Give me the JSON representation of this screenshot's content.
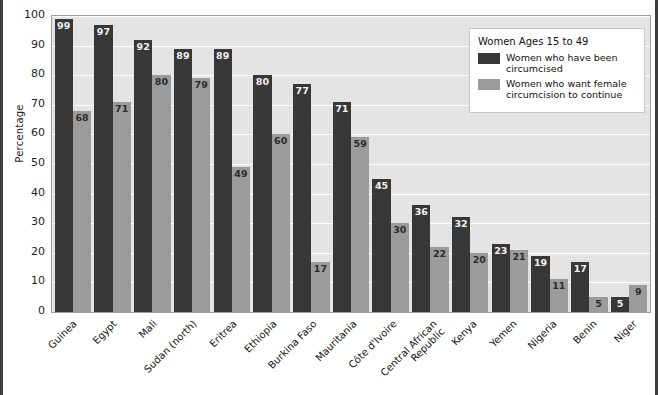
{
  "chart_data": {
    "type": "bar",
    "title": "",
    "xlabel": "",
    "ylabel": "Percentage",
    "ylim": [
      0,
      100
    ],
    "yticks": [
      100,
      90,
      80,
      70,
      60,
      50,
      40,
      30,
      20,
      10,
      0
    ],
    "grid": true,
    "legend_position": "top-right",
    "legend_title": "Women Ages 15 to 49",
    "categories": [
      "Guinea",
      "Egypt",
      "Mali",
      "Sudan (north)",
      "Eritrea",
      "Ethiopia",
      "Burkina Faso",
      "Mauritania",
      "Côte d'Ivoire",
      "Central African Republic",
      "Kenya",
      "Yemen",
      "Nigeria",
      "Benin",
      "Niger"
    ],
    "series": [
      {
        "name": "Women who have been circumcised",
        "color": "#373737",
        "values": [
          99,
          97,
          92,
          89,
          89,
          80,
          77,
          71,
          45,
          36,
          32,
          23,
          19,
          17,
          5
        ]
      },
      {
        "name": "Women who want female circumcision to continue",
        "color": "#9b9b9b",
        "values": [
          68,
          71,
          80,
          79,
          49,
          60,
          17,
          59,
          30,
          22,
          20,
          21,
          11,
          5,
          9
        ]
      }
    ]
  },
  "axis": {
    "y_title": "Percentage"
  },
  "legend": {
    "title": "Women Ages 15 to 49",
    "entries": [
      {
        "swatch": "dark",
        "line1": "Women who have been",
        "line2": "circumcised"
      },
      {
        "swatch": "light",
        "line1": "Women who want female",
        "line2": "circumcision to continue"
      }
    ]
  },
  "category_label_lines": [
    [
      "Guinea",
      ""
    ],
    [
      "Egypt",
      ""
    ],
    [
      "Mali",
      ""
    ],
    [
      "Sudan (north)",
      ""
    ],
    [
      "Eritrea",
      ""
    ],
    [
      "Ethiopia",
      ""
    ],
    [
      "Burkina Faso",
      ""
    ],
    [
      "Mauritania",
      ""
    ],
    [
      "Côte d'Ivoire",
      ""
    ],
    [
      "Central African",
      "Republic"
    ],
    [
      "Kenya",
      ""
    ],
    [
      "Yemen",
      ""
    ],
    [
      "Nigeria",
      ""
    ],
    [
      "Benin",
      ""
    ],
    [
      "Niger",
      ""
    ]
  ],
  "colors": {
    "series_dark": "#373737",
    "series_light": "#9b9b9b",
    "plot_background": "#e4e4e4",
    "gridline": "#fdfdfd",
    "frame": "#3f3f3f"
  }
}
